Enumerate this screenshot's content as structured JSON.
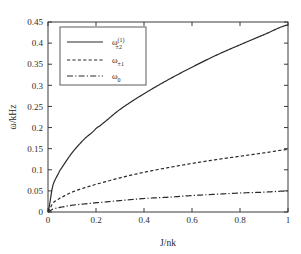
{
  "chart_data": {
    "type": "line",
    "title": "",
    "xlabel": "J/nk",
    "ylabel": "ω/kHz",
    "xlim": [
      0,
      1
    ],
    "ylim": [
      0,
      0.45
    ],
    "grid": false,
    "legend_position": "upper-left",
    "x_ticks": [
      "0",
      "0.2",
      "0.4",
      "0.6",
      "0.8",
      "1"
    ],
    "x_tick_values": [
      0,
      0.2,
      0.4,
      0.6,
      0.8,
      1
    ],
    "y_ticks": [
      "0",
      "0.05",
      "0.1",
      "0.15",
      "0.2",
      "0.25",
      "0.3",
      "0.35",
      "0.4",
      "0.45"
    ],
    "y_tick_values": [
      0,
      0.05,
      0.1,
      0.15,
      0.2,
      0.25,
      0.3,
      0.35,
      0.4,
      0.45
    ],
    "x": [
      0,
      0.02,
      0.05,
      0.1,
      0.15,
      0.2,
      0.3,
      0.4,
      0.5,
      0.6,
      0.7,
      0.8,
      0.9,
      1.0
    ],
    "series": [
      {
        "name": "ω±₂⁽¹⁾",
        "style": "solid",
        "values": [
          0,
          0.063,
          0.099,
          0.14,
          0.172,
          0.198,
          0.243,
          0.28,
          0.313,
          0.343,
          0.371,
          0.396,
          0.42,
          0.443
        ]
      },
      {
        "name": "ω±₁",
        "style": "dashed",
        "values": [
          0,
          0.021,
          0.033,
          0.047,
          0.057,
          0.066,
          0.081,
          0.094,
          0.105,
          0.115,
          0.124,
          0.132,
          0.14,
          0.148
        ]
      },
      {
        "name": "ω₀",
        "style": "dashdot",
        "values": [
          0,
          0.007,
          0.011,
          0.016,
          0.019,
          0.022,
          0.027,
          0.032,
          0.035,
          0.039,
          0.042,
          0.045,
          0.047,
          0.05
        ]
      }
    ]
  },
  "legend": {
    "entries": [
      {
        "base": "ω",
        "sup": "(1)",
        "sub": "±2",
        "style": "solid"
      },
      {
        "base": "ω",
        "sup": "",
        "sub": "±1",
        "style": "dashed"
      },
      {
        "base": "ω",
        "sup": "",
        "sub": "0",
        "style": "dashdot"
      }
    ]
  },
  "axes": {
    "x_title": "J/nk",
    "y_title": "ω/kHz"
  }
}
